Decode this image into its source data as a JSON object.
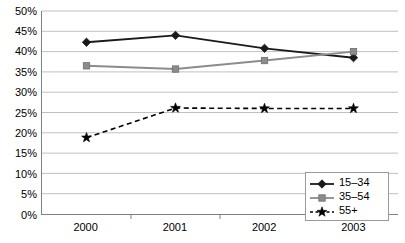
{
  "chart_data": {
    "type": "line",
    "title": "",
    "xlabel": "",
    "ylabel": "",
    "categories": [
      "2000",
      "2001",
      "2002",
      "2003"
    ],
    "ylim": [
      0,
      50
    ],
    "ytick_step": 5,
    "ytick_labels": [
      "50%",
      "45%",
      "40%",
      "35%",
      "30%",
      "25%",
      "20%",
      "15%",
      "10%",
      "5%",
      "0%"
    ],
    "ytick_values": [
      50,
      45,
      40,
      35,
      30,
      25,
      20,
      15,
      10,
      5,
      0
    ],
    "grid": "horizontal",
    "legend_position": "bottom-right-inside",
    "series": [
      {
        "name": "15–34",
        "values": [
          42.3,
          44.0,
          40.8,
          38.5
        ],
        "color": "#1a1a1a",
        "marker": "diamond",
        "line_style": "solid"
      },
      {
        "name": "35–54",
        "values": [
          36.5,
          35.7,
          37.8,
          40.0
        ],
        "color": "#8c8c8c",
        "marker": "square",
        "line_style": "solid"
      },
      {
        "name": "55+",
        "values": [
          18.8,
          26.1,
          26.0,
          26.0
        ],
        "color": "#000000",
        "marker": "star",
        "line_style": "dashed"
      }
    ]
  },
  "axis": {
    "line_color": "#808080",
    "grid_color": "#c0c0c0"
  },
  "legend": {
    "items": [
      {
        "label": "15–34"
      },
      {
        "label": "35–54"
      },
      {
        "label": "55+"
      }
    ]
  }
}
